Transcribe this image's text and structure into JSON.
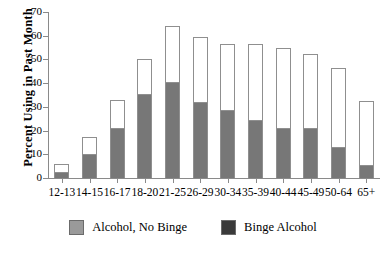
{
  "chart_data": {
    "type": "bar",
    "stacked": true,
    "title": "",
    "xlabel": "",
    "ylabel": "Percent Using in Past Month",
    "ylim": [
      0,
      70
    ],
    "yticks": [
      0,
      10,
      20,
      30,
      40,
      50,
      60,
      70
    ],
    "grid": false,
    "legend_position": "bottom-center",
    "categories": [
      "12-13",
      "14-15",
      "16-17",
      "18-20",
      "21-25",
      "26-29",
      "30-34",
      "35-39",
      "40-44",
      "45-49",
      "50-64",
      "65+"
    ],
    "series": [
      {
        "name": "Binge Alcohol",
        "color": "#777777",
        "values": [
          2.5,
          10.0,
          21.0,
          35.5,
          40.5,
          32.0,
          28.5,
          24.5,
          21.0,
          21.0,
          13.0,
          5.5
        ]
      },
      {
        "name": "Alcohol, No Binge",
        "color": "#ffffff",
        "values": [
          3.5,
          7.5,
          12.0,
          14.5,
          23.5,
          27.5,
          28.0,
          32.0,
          34.0,
          31.5,
          33.5,
          27.0
        ]
      }
    ],
    "totals": [
      6.0,
      17.5,
      33.0,
      50.0,
      64.0,
      59.5,
      56.5,
      56.5,
      55.0,
      52.5,
      46.5,
      32.5
    ]
  },
  "axis": {
    "y_title": "Percent Using in Past Month",
    "y_tick_labels": [
      "70",
      "60",
      "50",
      "40",
      "30",
      "20",
      "10",
      "0"
    ],
    "x_tick_labels": [
      "12-13",
      "14-15",
      "16-17",
      "18-20",
      "21-25",
      "26-29",
      "30-34",
      "35-39",
      "40-44",
      "45-49",
      "50-64",
      "65+"
    ]
  },
  "legend": {
    "entries": [
      {
        "label": "Alcohol, No Binge",
        "color": "#9a9a9a"
      },
      {
        "label": "Binge Alcohol",
        "color": "#3a3a3a"
      }
    ]
  },
  "colors": {
    "bar_binge": "#777777",
    "bar_total_fill": "#ffffff",
    "bar_outline": "#8f8f8f",
    "axis": "#8a8a8a",
    "text": "#000000",
    "background": "#ffffff"
  }
}
